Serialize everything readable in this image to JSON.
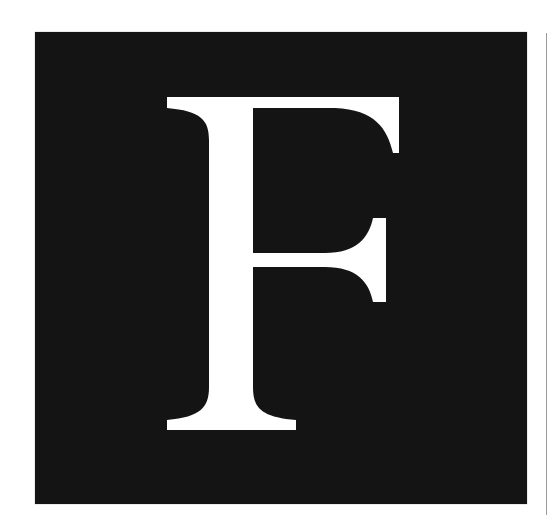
{
  "logo": {
    "letter": "F",
    "description": "White serif letter F on a black square",
    "colors": {
      "background": "#141414",
      "letter": "#ffffff",
      "page": "#ffffff",
      "rule": "#9a9a9a"
    }
  }
}
